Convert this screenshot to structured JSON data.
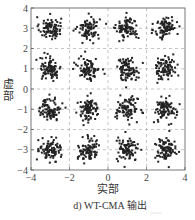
{
  "chart_data": {
    "type": "scatter",
    "title": "",
    "caption": "d) WT-CMA 输出",
    "xlabel": "实部",
    "ylabel": "虚部",
    "xlim": [
      -4,
      4
    ],
    "ylim": [
      -4,
      4
    ],
    "xticks": [
      -4,
      -2,
      0,
      2,
      4
    ],
    "yticks": [
      -4,
      -3,
      -2,
      -1,
      0,
      1,
      2,
      3,
      4
    ],
    "grid": true,
    "grid_style": "dashed",
    "legend": null,
    "marker": "*",
    "marker_color": "#222222",
    "points_per_cluster": 90,
    "cluster_spread": 0.28,
    "clusters": [
      {
        "x": -3,
        "y": 3
      },
      {
        "x": -1,
        "y": 3
      },
      {
        "x": 1,
        "y": 3
      },
      {
        "x": 3,
        "y": 3
      },
      {
        "x": -3,
        "y": 1
      },
      {
        "x": -1,
        "y": 1
      },
      {
        "x": 1,
        "y": 1
      },
      {
        "x": 3,
        "y": 1
      },
      {
        "x": -3,
        "y": -1
      },
      {
        "x": -1,
        "y": -1
      },
      {
        "x": 1,
        "y": -1
      },
      {
        "x": 3,
        "y": -1
      },
      {
        "x": -3,
        "y": -3
      },
      {
        "x": -1,
        "y": -3
      },
      {
        "x": 1,
        "y": -3
      },
      {
        "x": 3,
        "y": -3
      }
    ]
  },
  "labels": {
    "xlabel": "实部",
    "ylabel": "虚部",
    "caption": "d) WT-CMA 输出"
  }
}
